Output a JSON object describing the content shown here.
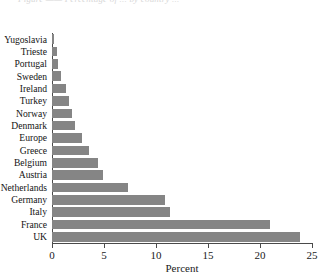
{
  "figure": {
    "caption_remnant": "Figure ——  Percentage of ... by country ...",
    "background_color": "#ffffff",
    "bar_color": "#858585",
    "axis_color": "#4a4a4a"
  },
  "chart_data": {
    "type": "bar",
    "orientation": "horizontal",
    "title": "",
    "subtitle": "",
    "xlabel": "Percent",
    "ylabel": "",
    "xlim": [
      0,
      25
    ],
    "ylim": null,
    "grid": false,
    "legend": null,
    "xticks": [
      0,
      5,
      10,
      15,
      20,
      25
    ],
    "xticklabels": [
      "0",
      "5",
      "10",
      "15",
      "20",
      "25"
    ],
    "categories": [
      "Yugoslavia",
      "Trieste",
      "Portugal",
      "Sweden",
      "Ireland",
      "Turkey",
      "Norway",
      "Denmark",
      "Europe",
      "Greece",
      "Belgium",
      "Austria",
      "Netherlands",
      "Germany",
      "Italy",
      "France",
      "UK"
    ],
    "values": [
      0.2,
      0.5,
      0.6,
      0.9,
      1.3,
      1.6,
      1.9,
      2.2,
      2.9,
      3.6,
      4.4,
      4.9,
      7.3,
      10.9,
      11.3,
      21.0,
      23.8
    ],
    "annotations": []
  }
}
